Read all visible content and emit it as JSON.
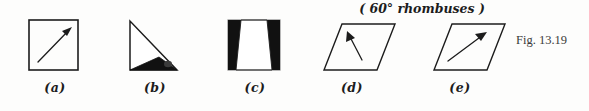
{
  "figure": {
    "number_label": "Fig. 13.19",
    "group_caption": "( 60° rhombuses )",
    "background_color": "#fdfdfc",
    "ink_color": "#1c1c1c",
    "fill_color": "#111111"
  },
  "panels": [
    {
      "id": "a",
      "label": "(a)",
      "shape": "square",
      "marking": "diagonal arrow pointing up-right",
      "filled": false
    },
    {
      "id": "b",
      "label": "(b)",
      "shape": "right triangle",
      "marking": "black filled sub-triangle at base",
      "filled": true
    },
    {
      "id": "c",
      "label": "(c)",
      "shape": "square",
      "marking": "two black wedges leaving white trapezoid",
      "filled": true
    },
    {
      "id": "d",
      "label": "(d)",
      "shape": "60 degree rhombus",
      "marking": "arrow pointing up-left",
      "filled": false
    },
    {
      "id": "e",
      "label": "(e)",
      "shape": "60 degree rhombus",
      "marking": "arrow pointing up-right",
      "filled": false
    }
  ]
}
